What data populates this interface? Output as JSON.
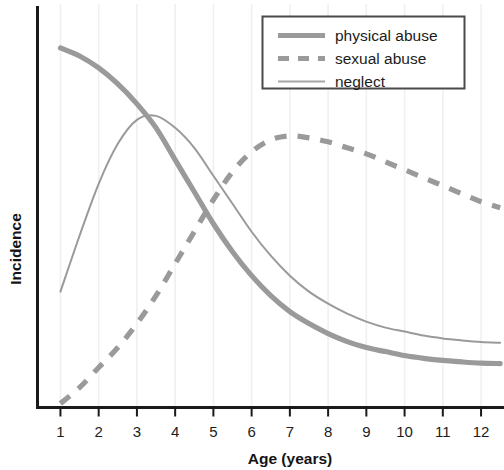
{
  "chart_data": {
    "type": "line",
    "title": "",
    "xlabel": "Age (years)",
    "ylabel": "Incidence",
    "xlim": [
      0.4,
      12.6
    ],
    "ylim": [
      0,
      100
    ],
    "grid": "vertical-only-faint",
    "y_axis_ticks": "none",
    "legend_position": "top-right",
    "x_tick_labels": [
      "1",
      "2",
      "3",
      "4",
      "5",
      "6",
      "7",
      "8",
      "9",
      "10",
      "11",
      "12"
    ],
    "x": [
      1,
      1.5,
      2,
      2.5,
      3,
      3.5,
      4,
      4.5,
      5,
      5.5,
      6,
      6.5,
      7,
      7.5,
      8,
      8.5,
      9,
      9.5,
      10,
      10.5,
      11,
      11.5,
      12,
      12.5
    ],
    "series": [
      {
        "name": "physical abuse",
        "style": "solid-thick",
        "color": "#9a9a9a",
        "values": [
          90,
          88,
          85,
          81,
          76,
          70,
          62,
          54,
          46,
          39,
          33,
          28,
          24,
          21,
          18.5,
          16.5,
          15,
          14,
          13,
          12.3,
          11.8,
          11.4,
          11.1,
          11.0
        ]
      },
      {
        "name": "sexual abuse",
        "style": "dashed-thick",
        "color": "#9a9a9a",
        "values": [
          1,
          5,
          10,
          15,
          21,
          28,
          36,
          44,
          52,
          59,
          64,
          67,
          68,
          67.5,
          66.5,
          65,
          63.5,
          61.5,
          59.5,
          57.5,
          55.5,
          53.5,
          51.5,
          50
        ]
      },
      {
        "name": "neglect",
        "style": "solid-thin",
        "color": "#9a9a9a",
        "values": [
          29,
          43,
          56,
          66,
          72,
          73,
          70,
          65,
          58,
          51,
          44,
          38,
          33,
          29,
          26,
          23.5,
          21.5,
          20,
          19,
          18,
          17.3,
          16.8,
          16.4,
          16.2
        ]
      }
    ],
    "legend": [
      {
        "label": "physical abuse",
        "style": "solid-thick"
      },
      {
        "label": "sexual abuse",
        "style": "dashed-thick"
      },
      {
        "label": "neglect",
        "style": "solid-thin"
      }
    ],
    "colors": {
      "line_gray": "#9a9a9a",
      "line_gray_thin": "#a6a6a6",
      "axis": "#1a1a1a",
      "gridline": "#f0f0f0",
      "legend_border": "#4a4a4a",
      "text": "#1c1c1c",
      "background": "#ffffff"
    }
  }
}
